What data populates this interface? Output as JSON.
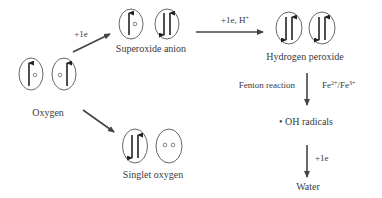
{
  "diagram": {
    "colors": {
      "text": "#3a3a3a",
      "arrow": "#444444",
      "orbital": "#555555",
      "electron": "#222222",
      "background": "#ffffff"
    },
    "nodes": {
      "oxygen": {
        "label": "Oxygen",
        "orbitals": [
          "up-arrow+empty-circle",
          "empty-circle+up-arrow"
        ]
      },
      "superoxide": {
        "label": "Superoxide anion",
        "orbitals": [
          "up-arrow+empty-circle",
          "down-up-pair"
        ]
      },
      "hydrogen_peroxide": {
        "label": "Hydrogen peroxide",
        "orbitals": [
          "down-up-pair",
          "down-up-pair"
        ]
      },
      "singlet_oxygen": {
        "label": "Singlet oxygen",
        "orbitals": [
          "down-up-pair",
          "two-empty-circles"
        ]
      },
      "oh_radicals": {
        "label": "• OH radicals"
      },
      "water": {
        "label": "Water"
      }
    },
    "edges": {
      "oxygen_to_superoxide": {
        "label": "+1e"
      },
      "superoxide_to_peroxide": {
        "label": "+1e, H",
        "label_sup": "+"
      },
      "oxygen_to_singlet": {
        "label": ""
      },
      "peroxide_to_oh": {
        "left_label": "Fenton reaction",
        "right_label_parts": [
          "Fe",
          "2+",
          "/Fe",
          "3+"
        ]
      },
      "oh_to_water": {
        "label": "+1e"
      }
    }
  }
}
